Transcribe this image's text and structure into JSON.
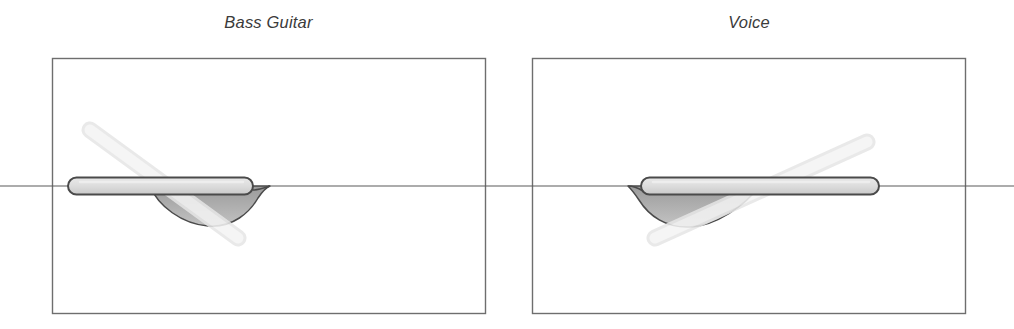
{
  "figure": {
    "background_color": "#ffffff",
    "width": 1014,
    "height": 329
  },
  "panels": [
    {
      "id": "bass-guitar",
      "title": "Bass Guitar",
      "frame": {
        "x": 52,
        "y": 58,
        "width": 433,
        "height": 255
      },
      "axis": {
        "y": 186,
        "x_start": 0,
        "x_end": 507,
        "color": "#5a5a5a",
        "width": 1.1
      },
      "pill": {
        "x_start": 68,
        "x_end": 253,
        "y_center": 186,
        "height": 17,
        "radius": 8.5,
        "fill": "#d9d9d9",
        "stroke": "#4a4a4a",
        "stroke_width": 2.1
      },
      "lobe": {
        "description": "shaded concave region below axis under right part of pill",
        "x_start": 152,
        "x_min": 213,
        "y_min": 226,
        "x_end": 270,
        "fill": "#a8a8a8",
        "stroke": "#4a4a4a"
      },
      "diagonal_bar": {
        "x1": 90,
        "y1": 130,
        "x2": 238,
        "y2": 238,
        "thickness": 15,
        "fill": "#eeeeee",
        "stroke": "#e2e2e2",
        "direction": "descending"
      }
    },
    {
      "id": "voice",
      "title": "Voice",
      "frame": {
        "x": 532,
        "y": 58,
        "width": 434,
        "height": 255
      },
      "axis": {
        "y": 186,
        "x_start": 507,
        "x_end": 1014,
        "color": "#5a5a5a",
        "width": 1.1
      },
      "pill": {
        "x_start": 641,
        "x_end": 879,
        "y_center": 186,
        "height": 17,
        "radius": 8.5,
        "fill": "#d9d9d9",
        "stroke": "#4a4a4a",
        "stroke_width": 2.1
      },
      "lobe": {
        "description": "shaded concave region below axis under left part of pill",
        "x_start": 626,
        "x_min": 672,
        "y_min": 227,
        "x_end": 760,
        "fill": "#a8a8a8",
        "stroke": "#4a4a4a"
      },
      "diagonal_bar": {
        "x1": 655,
        "y1": 238,
        "x2": 867,
        "y2": 142,
        "thickness": 15,
        "fill": "#eeeeee",
        "stroke": "#e2e2e2",
        "direction": "ascending"
      }
    }
  ],
  "colors": {
    "frame_stroke": "#6e6e6e",
    "axis": "#5a5a5a",
    "pill_fill_light": "#e2e2e2",
    "pill_fill_dark": "#cfcfcf",
    "pill_stroke": "#4a4a4a",
    "lobe_fill": "#a6a6a6",
    "bar_fill": "#efefef",
    "title_text": "#3b3b3b"
  }
}
